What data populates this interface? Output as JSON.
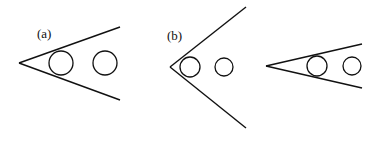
{
  "figure": {
    "stroke_color": "#111111",
    "background": "#ffffff",
    "panels": [
      {
        "label": "(a)",
        "label_pos": [
          37,
          38
        ],
        "apex": [
          19,
          63
        ],
        "upper_end": [
          120,
          27
        ],
        "lower_end": [
          120,
          100
        ],
        "circles": [
          {
            "cx": 61,
            "cy": 63,
            "r": 12
          },
          {
            "cx": 105,
            "cy": 63,
            "r": 12
          }
        ]
      },
      {
        "label": "(b)",
        "label_pos": [
          167,
          40
        ],
        "apex": [
          170,
          67
        ],
        "upper_end": [
          246,
          7
        ],
        "lower_end": [
          246,
          128
        ],
        "circles": [
          {
            "cx": 190,
            "cy": 67,
            "r": 10
          },
          {
            "cx": 224,
            "cy": 67,
            "r": 9
          }
        ]
      },
      {
        "label": "",
        "apex": [
          266,
          66
        ],
        "upper_end": [
          362,
          44
        ],
        "lower_end": [
          362,
          88
        ],
        "circles": [
          {
            "cx": 317,
            "cy": 66,
            "r": 10
          },
          {
            "cx": 352,
            "cy": 66,
            "r": 9
          }
        ]
      }
    ]
  }
}
